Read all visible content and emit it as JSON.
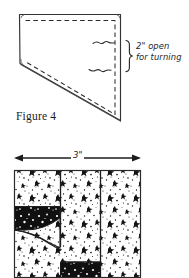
{
  "page": {
    "background_color": "#ffffff",
    "ink_color": "#1b1b1b",
    "width": 189,
    "height": 278
  },
  "figure4": {
    "caption": "Figure 4",
    "callout": {
      "line1": "2\" open",
      "line2": "for turning",
      "brace": "}"
    },
    "shape": {
      "description": "sewn fabric piece outline with dashed stitching line",
      "outline_points": "19,14 121,14 121,120 20,63",
      "stitch_points": "25,20 115,20 115,114 26,62",
      "opening_marks": 2
    }
  },
  "figure5": {
    "dimension_label": "3\"",
    "dimension": {
      "arrow_left_x": 14,
      "arrow_right_x": 141,
      "arrow_y": 158
    },
    "fabric": {
      "description": "speckled floral print fabric folded into three panels",
      "panels": 3,
      "fold_lines_x": [
        60,
        100
      ],
      "top_y": 170,
      "bottom_y": 278,
      "left_x": 14,
      "right_x": 141,
      "print_color": "#141414",
      "shadow_color": "#0d0d0d"
    }
  }
}
